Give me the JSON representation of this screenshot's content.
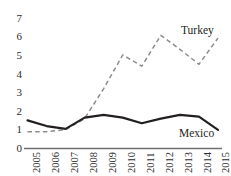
{
  "chart_data": {
    "type": "line",
    "title": "",
    "subtitle": "",
    "xlabel": "",
    "ylabel": "",
    "categories": [
      "2005",
      "2006",
      "2007",
      "2008",
      "2009",
      "2010",
      "2011",
      "2012",
      "2013",
      "2014",
      "2015"
    ],
    "x": [
      2005,
      2006,
      2007,
      2008,
      2009,
      2010,
      2011,
      2012,
      2013,
      2014,
      2015
    ],
    "ylim": [
      0,
      7
    ],
    "xlim": [
      2005,
      2015
    ],
    "yticks": [
      0,
      1,
      2,
      3,
      4,
      5,
      6,
      7
    ],
    "ytick_labels": [
      "0",
      "1",
      "2",
      "3",
      "4",
      "5",
      "6",
      "7"
    ],
    "grid": false,
    "legend_position": "inline-annotation",
    "series": [
      {
        "name": "Turkey",
        "values": [
          0.9,
          0.9,
          1.0,
          1.6,
          3.2,
          5.0,
          4.4,
          6.05,
          5.3,
          4.5,
          5.9
        ],
        "style": "dashed",
        "color": "#8c8c8c",
        "label_text": "Turkey"
      },
      {
        "name": "Mexico",
        "values": [
          1.5,
          1.2,
          1.05,
          1.65,
          1.8,
          1.65,
          1.35,
          1.6,
          1.8,
          1.7,
          1.0
        ],
        "style": "solid",
        "color": "#231f20",
        "label_text": "Mexico"
      }
    ],
    "annotations": [
      {
        "text": "Turkey",
        "series": "Turkey"
      },
      {
        "text": "Mexico",
        "series": "Mexico"
      }
    ],
    "colors": {
      "background": "#ffffff",
      "axis": "#6f6f6f",
      "text": "#231f20",
      "turkey_line": "#8c8c8c",
      "mexico_line": "#231f20"
    }
  },
  "axis": {
    "y_tick_labels": [
      "7",
      "6",
      "5",
      "4",
      "3",
      "2",
      "1",
      "0"
    ],
    "x_tick_labels": [
      "2005",
      "2006",
      "2007",
      "2008",
      "2009",
      "2010",
      "2011",
      "2012",
      "2013",
      "2014",
      "2015"
    ]
  },
  "labels": {
    "turkey": "Turkey",
    "mexico": "Mexico"
  }
}
